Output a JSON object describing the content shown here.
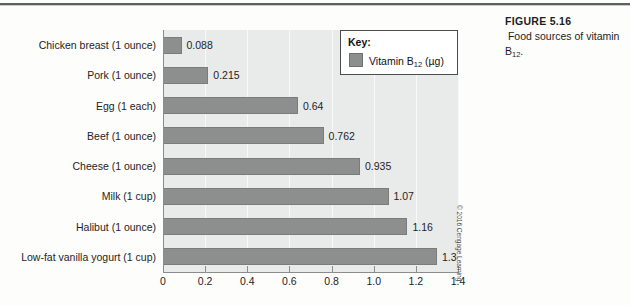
{
  "figure": {
    "number_label": "FIGURE 5.16",
    "caption_lead": "Food",
    "caption_rest": "sources of vitamin B",
    "caption_sub": "12",
    "caption_end": ".",
    "credit": "© 2016 Cengage Learning"
  },
  "legend": {
    "title": "Key:",
    "series_name_main": "Vitamin B",
    "series_name_sub": "12",
    "series_name_unit": " (µg)",
    "swatch_color": "#8d8e8e"
  },
  "chart_data": {
    "type": "bar",
    "orientation": "horizontal",
    "title": "Food sources of vitamin B12",
    "xlabel": "",
    "ylabel": "",
    "xlim": [
      0,
      1.4
    ],
    "grid": true,
    "legend_position": "top-right-inside",
    "series_name": "Vitamin B12 (µg)",
    "bar_color": "#8d8e8e",
    "plot_background": "#e9eaea",
    "categories": [
      "Chicken breast (1 ounce)",
      "Pork (1 ounce)",
      "Egg (1 each)",
      "Beef (1 ounce)",
      "Cheese (1 ounce)",
      "Milk (1 cup)",
      "Halibut (1 ounce)",
      "Low-fat vanilla yogurt (1 cup)"
    ],
    "values": [
      0.088,
      0.215,
      0.64,
      0.762,
      0.935,
      1.07,
      1.16,
      1.3
    ],
    "value_labels": [
      "0.088",
      "0.215",
      "0.64",
      "0.762",
      "0.935",
      "1.07",
      "1.16",
      "1.3"
    ],
    "xticks": [
      0,
      0.2,
      0.4,
      0.6,
      0.8,
      1.0,
      1.2,
      1.4
    ],
    "xtick_labels": [
      "0",
      "0.2",
      "0.4",
      "0.6",
      "0.8",
      "1.0",
      "1.2",
      "1.4"
    ]
  }
}
